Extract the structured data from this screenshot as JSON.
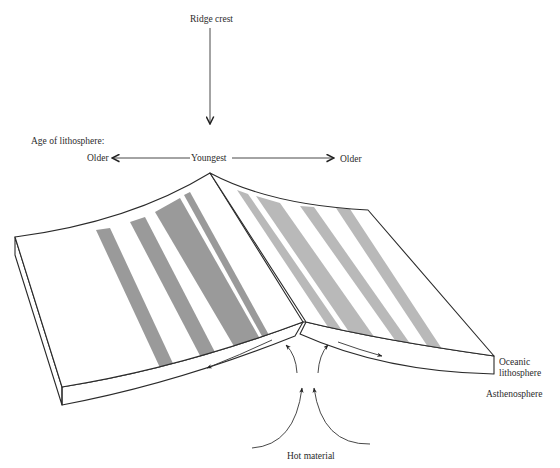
{
  "figure": {
    "title_label": "Ridge crest",
    "age_axis": {
      "heading": "Age of lithosphere:",
      "left_label": "Older",
      "center_label": "Youngest",
      "right_label": "Older"
    },
    "layers": {
      "lithosphere_line1": "Oceanic",
      "lithosphere_line2": "lithosphere",
      "asthenosphere": "Asthenosphere"
    },
    "source_label": "Hot material"
  },
  "colors": {
    "background": "#ffffff",
    "outline": "#2a2a2a",
    "stripe_left": "#9a9a9a",
    "stripe_right": "#b9b9b9"
  },
  "stripes": {
    "left_side": [
      {
        "name": "stripe-left-1",
        "position": "outer"
      },
      {
        "name": "stripe-left-2",
        "position": "middle"
      },
      {
        "name": "stripe-left-3",
        "position": "wide-inner"
      },
      {
        "name": "stripe-left-4",
        "position": "thin-inner"
      }
    ],
    "right_side": [
      {
        "name": "stripe-right-1",
        "position": "thin-inner"
      },
      {
        "name": "stripe-right-2",
        "position": "wide-inner"
      },
      {
        "name": "stripe-right-3",
        "position": "middle"
      },
      {
        "name": "stripe-right-4",
        "position": "outer"
      }
    ]
  }
}
